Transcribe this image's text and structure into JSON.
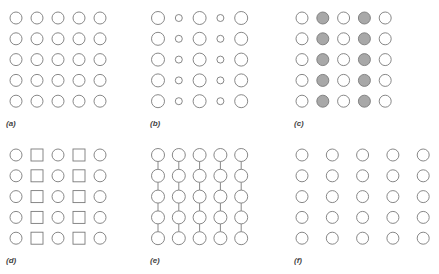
{
  "figure": {
    "stroke_color": "#7a7a7a",
    "fill_highlight": "#a8a8a8",
    "panels": [
      {
        "id": "a",
        "label": "(a)",
        "description": "uniform grid of circles",
        "origin": [
          16,
          18
        ],
        "dx": 21,
        "dy": 20.8,
        "shapes": [
          [
            "circle",
            "circle",
            "circle",
            "circle",
            "circle"
          ]
        ],
        "radii": [
          6,
          6,
          6,
          6,
          6
        ],
        "filled_cols": [],
        "connect_vertical": false,
        "label_pos": [
          6,
          126
        ]
      },
      {
        "id": "b",
        "label": "(b)",
        "description": "alternating large and small circles by column",
        "origin": [
          158,
          18
        ],
        "dx": 20.8,
        "dy": 20.8,
        "shapes": [
          [
            "circle",
            "circle",
            "circle",
            "circle",
            "circle"
          ]
        ],
        "radii": [
          6.5,
          3.5,
          6.5,
          3.5,
          6.5
        ],
        "filled_cols": [],
        "connect_vertical": false,
        "label_pos": [
          150,
          126
        ]
      },
      {
        "id": "c",
        "label": "(c)",
        "description": "columns 2 and 4 filled gray",
        "origin": [
          302,
          18
        ],
        "dx": 20.8,
        "dy": 20.8,
        "shapes": [
          [
            "circle",
            "circle",
            "circle",
            "circle",
            "circle"
          ]
        ],
        "radii": [
          6,
          6,
          6,
          6,
          6
        ],
        "filled_cols": [
          1,
          3
        ],
        "connect_vertical": false,
        "label_pos": [
          294,
          126
        ]
      },
      {
        "id": "d",
        "label": "(d)",
        "description": "alternating columns of circles and squares",
        "origin": [
          16,
          155
        ],
        "dx": 21,
        "dy": 20.8,
        "shapes": [
          [
            "circle",
            "square",
            "circle",
            "square",
            "circle"
          ]
        ],
        "radii": [
          6,
          6,
          6,
          6,
          6
        ],
        "filled_cols": [],
        "connect_vertical": false,
        "label_pos": [
          6,
          263
        ]
      },
      {
        "id": "e",
        "label": "(e)",
        "description": "circles connected vertically within columns",
        "origin": [
          158,
          155
        ],
        "dx": 20.8,
        "dy": 20.8,
        "shapes": [
          [
            "circle",
            "circle",
            "circle",
            "circle",
            "circle"
          ]
        ],
        "radii": [
          6.5,
          6.5,
          6.5,
          6.5,
          6.5
        ],
        "filled_cols": [],
        "connect_vertical": true,
        "label_pos": [
          150,
          263
        ]
      },
      {
        "id": "f",
        "label": "(f)",
        "description": "wider horizontal spacing of circles",
        "origin": [
          302,
          155
        ],
        "dx": 30.3,
        "dy": 20.8,
        "shapes": [
          [
            "circle",
            "circle",
            "circle",
            "circle",
            "circle"
          ]
        ],
        "radii": [
          6,
          6,
          6,
          6,
          6
        ],
        "filled_cols": [],
        "connect_vertical": false,
        "label_pos": [
          294,
          263
        ]
      }
    ],
    "rows": 5,
    "cols": 5
  }
}
